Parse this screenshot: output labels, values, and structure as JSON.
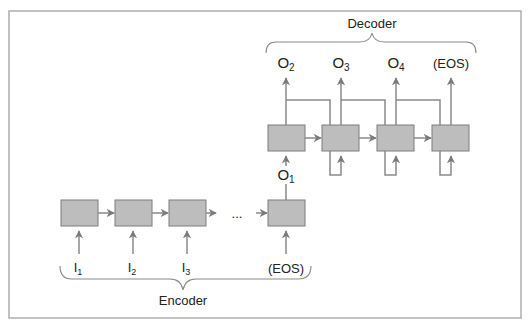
{
  "diagram": {
    "type": "encoder-decoder-rnn",
    "colors": {
      "cell_fill": "#bdbdbd",
      "cell_stroke": "#7d7d7d",
      "arrow": "#8a8a8a",
      "frame": "#a8a8a8",
      "text": "#222222"
    },
    "decoder": {
      "label": "Decoder",
      "outputs": [
        {
          "main": "O",
          "sub": "2"
        },
        {
          "main": "O",
          "sub": "3"
        },
        {
          "main": "O",
          "sub": "4"
        },
        {
          "main": "(EOS)",
          "sub": ""
        }
      ],
      "cells": 4
    },
    "bridge": {
      "main": "O",
      "sub": "1"
    },
    "encoder": {
      "label": "Encoder",
      "inputs": [
        {
          "main": "I",
          "sub": "1"
        },
        {
          "main": "I",
          "sub": "2"
        },
        {
          "main": "I",
          "sub": "3"
        },
        {
          "main": "(EOS)",
          "sub": ""
        }
      ],
      "ellipsis": "...",
      "cells": 4
    }
  }
}
